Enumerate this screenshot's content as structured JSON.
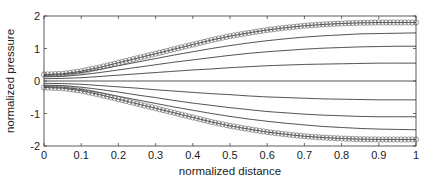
{
  "chart_data": {
    "type": "line",
    "title": "",
    "xlabel": "normalized distance",
    "ylabel": "normalized pressure",
    "xlim": [
      0,
      1
    ],
    "ylim": [
      -2,
      2
    ],
    "xticks": [
      0,
      0.1,
      0.2,
      0.3,
      0.4,
      0.5,
      0.6,
      0.7,
      0.8,
      0.9,
      1
    ],
    "xtick_labels": [
      "0",
      "0.1",
      "0.2",
      "0.3",
      "0.4",
      "0.5",
      "0.6",
      "0.7",
      "0.8",
      "0.9",
      "1"
    ],
    "yticks": [
      -2,
      -1,
      0,
      1,
      2
    ],
    "ytick_labels": [
      "-2",
      "-1",
      "0",
      "1",
      "2"
    ],
    "grid": false,
    "legend": null,
    "line_color": "#000000",
    "marker_edge_color": "#555555",
    "x": [
      0,
      0.05,
      0.1,
      0.15,
      0.2,
      0.25,
      0.3,
      0.35,
      0.4,
      0.45,
      0.5,
      0.55,
      0.6,
      0.65,
      0.7,
      0.75,
      0.8,
      0.85,
      0.9,
      0.95,
      1.0
    ],
    "series": [
      {
        "name": "envelope upper (markers)",
        "marker": "circle",
        "values": [
          0.2,
          0.22,
          0.3,
          0.42,
          0.56,
          0.7,
          0.84,
          0.98,
          1.12,
          1.26,
          1.38,
          1.48,
          1.57,
          1.64,
          1.7,
          1.74,
          1.77,
          1.79,
          1.8,
          1.8,
          1.8
        ]
      },
      {
        "name": "curve 1",
        "marker": "none",
        "values": [
          0.17,
          0.19,
          0.26,
          0.36,
          0.47,
          0.58,
          0.69,
          0.8,
          0.9,
          1.0,
          1.09,
          1.17,
          1.24,
          1.3,
          1.35,
          1.39,
          1.42,
          1.45,
          1.46,
          1.47,
          1.48
        ]
      },
      {
        "name": "curve 2",
        "marker": "none",
        "values": [
          0.13,
          0.14,
          0.19,
          0.26,
          0.34,
          0.42,
          0.5,
          0.58,
          0.65,
          0.72,
          0.79,
          0.85,
          0.9,
          0.94,
          0.98,
          1.01,
          1.03,
          1.05,
          1.06,
          1.07,
          1.07
        ]
      },
      {
        "name": "curve 3",
        "marker": "none",
        "values": [
          0.07,
          0.08,
          0.1,
          0.14,
          0.18,
          0.22,
          0.26,
          0.3,
          0.34,
          0.37,
          0.41,
          0.44,
          0.47,
          0.49,
          0.51,
          0.52,
          0.53,
          0.54,
          0.55,
          0.55,
          0.55
        ]
      },
      {
        "name": "curve 4",
        "marker": "none",
        "values": [
          0,
          0,
          0,
          0,
          0,
          0,
          0,
          0,
          0,
          0,
          0,
          0,
          0,
          0,
          0,
          0,
          0,
          0,
          0,
          0,
          0
        ]
      },
      {
        "name": "curve 5",
        "marker": "none",
        "values": [
          -0.07,
          -0.08,
          -0.1,
          -0.14,
          -0.18,
          -0.22,
          -0.27,
          -0.31,
          -0.35,
          -0.39,
          -0.42,
          -0.46,
          -0.49,
          -0.51,
          -0.53,
          -0.55,
          -0.56,
          -0.57,
          -0.58,
          -0.58,
          -0.58
        ]
      },
      {
        "name": "curve 6",
        "marker": "none",
        "values": [
          -0.13,
          -0.14,
          -0.19,
          -0.26,
          -0.34,
          -0.43,
          -0.51,
          -0.6,
          -0.68,
          -0.75,
          -0.82,
          -0.88,
          -0.94,
          -0.98,
          -1.02,
          -1.05,
          -1.07,
          -1.09,
          -1.1,
          -1.1,
          -1.1
        ]
      },
      {
        "name": "curve 7",
        "marker": "none",
        "values": [
          -0.17,
          -0.19,
          -0.26,
          -0.36,
          -0.47,
          -0.58,
          -0.69,
          -0.8,
          -0.9,
          -1.0,
          -1.09,
          -1.17,
          -1.24,
          -1.3,
          -1.35,
          -1.4,
          -1.43,
          -1.46,
          -1.48,
          -1.49,
          -1.5
        ]
      },
      {
        "name": "envelope lower (markers)",
        "marker": "circle",
        "values": [
          -0.2,
          -0.22,
          -0.3,
          -0.42,
          -0.56,
          -0.7,
          -0.84,
          -0.98,
          -1.12,
          -1.26,
          -1.38,
          -1.48,
          -1.57,
          -1.64,
          -1.7,
          -1.74,
          -1.77,
          -1.79,
          -1.8,
          -1.8,
          -1.8
        ]
      }
    ],
    "marker_spacing": 0.01
  }
}
